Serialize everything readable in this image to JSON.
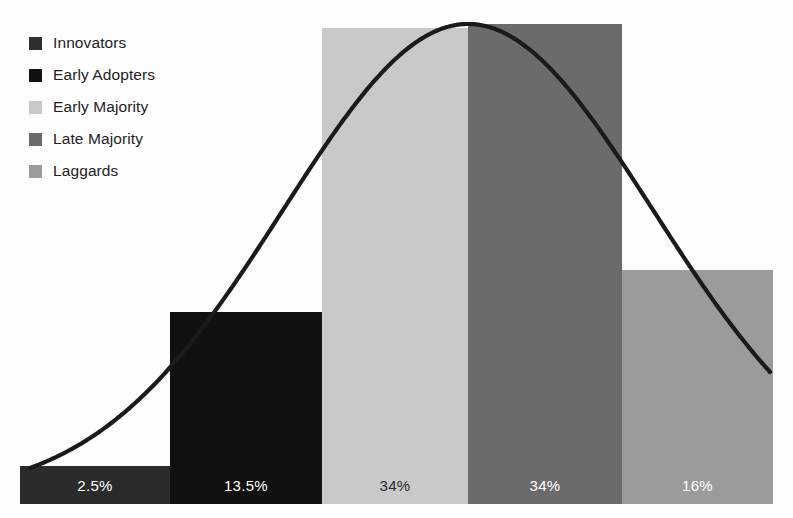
{
  "chart_data": {
    "type": "bar",
    "title": "",
    "subtitle": "",
    "xlabel": "",
    "ylabel": "",
    "grid": false,
    "legend_position": "top-left",
    "categories": [
      "Innovators",
      "Early Adopters",
      "Early Majority",
      "Late Majority",
      "Laggards"
    ],
    "values": [
      2.5,
      13.5,
      34,
      34,
      16
    ],
    "value_labels": [
      "2.5%",
      "13.5%",
      "34%",
      "34%",
      "16%"
    ],
    "ylim": [
      0,
      36
    ],
    "colors": [
      "#2b2b2b",
      "#111111",
      "#c9c9c9",
      "#6b6b6b",
      "#9b9b9b"
    ],
    "overlay": {
      "type": "line",
      "name": "bell-curve",
      "color": "#1a1a1a",
      "description": "normal distribution curve over the adoption bars"
    },
    "series": [
      {
        "name": "Technology Adoption Lifecycle",
        "values": [
          2.5,
          13.5,
          34,
          34,
          16
        ]
      }
    ]
  },
  "legend": {
    "items": [
      {
        "label": "Innovators",
        "color": "#2f2f2f"
      },
      {
        "label": "Early Adopters",
        "color": "#111111"
      },
      {
        "label": "Early Majority",
        "color": "#c9c9c9"
      },
      {
        "label": "Late Majority",
        "color": "#6b6b6b"
      },
      {
        "label": "Laggards",
        "color": "#9b9b9b"
      }
    ]
  },
  "bars": [
    {
      "label": "2.5%",
      "color": "#2b2b2b",
      "text_color": "#ffffff",
      "x": 20,
      "w": 150,
      "top": 466
    },
    {
      "label": "13.5%",
      "color": "#111111",
      "text_color": "#ffffff",
      "x": 170,
      "w": 152,
      "top": 312
    },
    {
      "label": "34%",
      "color": "#c9c9c9",
      "text_color": "#2a2a2a",
      "x": 322,
      "w": 146,
      "top": 28
    },
    {
      "label": "34%",
      "color": "#6b6b6b",
      "text_color": "#ffffff",
      "x": 468,
      "w": 154,
      "top": 24
    },
    {
      "label": "16%",
      "color": "#9b9b9b",
      "text_color": "#ffffff",
      "x": 622,
      "w": 151,
      "top": 270
    }
  ],
  "baseline": {
    "y": 504
  },
  "curve": {
    "color": "#1b1b1b",
    "width": 4.2
  }
}
